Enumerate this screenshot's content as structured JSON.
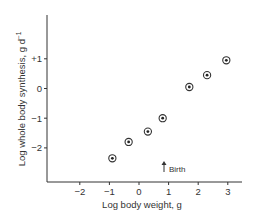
{
  "chart_data": {
    "type": "scatter",
    "title": "",
    "xlabel": "Log body weight, g",
    "ylabel": "Log whole body synthesis, g d",
    "ylabel_superscript": "−1",
    "xlim": [
      -2.95,
      3.4
    ],
    "ylim": [
      -2.95,
      2.48
    ],
    "x_ticks": [
      -2,
      -1,
      0,
      1,
      2,
      3
    ],
    "x_tick_labels": [
      "−2",
      "−1",
      "0",
      "1",
      "2",
      "3"
    ],
    "y_ticks": [
      1,
      0,
      -1,
      -2
    ],
    "y_tick_labels": [
      "+1",
      "0",
      "−1",
      "−2"
    ],
    "grid": false,
    "legend": null,
    "marker": "circle-with-center-dot",
    "series": [
      {
        "name": "Whole body protein synthesis",
        "points": [
          {
            "x": -0.9,
            "y": -2.35
          },
          {
            "x": -0.35,
            "y": -1.8
          },
          {
            "x": 0.3,
            "y": -1.45
          },
          {
            "x": 0.8,
            "y": -1.0
          },
          {
            "x": 1.7,
            "y": 0.05
          },
          {
            "x": 2.3,
            "y": 0.45
          },
          {
            "x": 2.95,
            "y": 0.95
          }
        ]
      }
    ],
    "annotations": [
      {
        "text": "Birth",
        "x": 0.85,
        "arrow": "up"
      }
    ]
  },
  "colors": {
    "axis": "#333333",
    "marker_ring": "#333333",
    "marker_dot": "#222222",
    "text": "#333333"
  }
}
